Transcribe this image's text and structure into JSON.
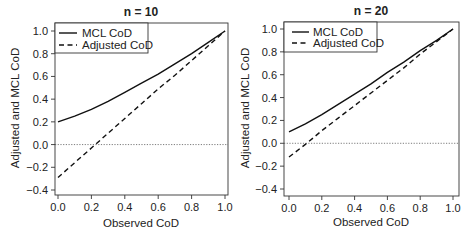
{
  "chart_data": [
    {
      "type": "line",
      "title": "n = 10",
      "xlabel": "Observed CoD",
      "ylabel": "Adjusted and MCL CoD",
      "xlim": [
        0.0,
        1.0
      ],
      "ylim": [
        -0.45,
        1.05
      ],
      "xticks": [
        "0.0",
        "0.2",
        "0.4",
        "0.6",
        "0.8",
        "1.0"
      ],
      "yticks": [
        "-0.4",
        "-0.2",
        "0.0",
        "0.2",
        "0.4",
        "0.6",
        "0.8",
        "1.0"
      ],
      "grid": false,
      "legend_position": "top-left",
      "reference_line": {
        "y": 0.0,
        "style": "dotted"
      },
      "x": [
        0.0,
        0.1,
        0.2,
        0.3,
        0.4,
        0.5,
        0.6,
        0.7,
        0.8,
        0.9,
        1.0
      ],
      "series": [
        {
          "name": "MCL CoD",
          "style": "solid",
          "values": [
            0.2,
            0.25,
            0.31,
            0.38,
            0.46,
            0.54,
            0.62,
            0.71,
            0.8,
            0.9,
            1.0
          ]
        },
        {
          "name": "Adjusted CoD",
          "style": "dashed",
          "values": [
            -0.29,
            -0.16,
            -0.03,
            0.1,
            0.23,
            0.36,
            0.49,
            0.61,
            0.74,
            0.87,
            1.0
          ]
        }
      ]
    },
    {
      "type": "line",
      "title": "n = 20",
      "xlabel": "Observed CoD",
      "ylabel": "Adjusted and MCL CoD",
      "xlim": [
        0.0,
        1.0
      ],
      "ylim": [
        -0.45,
        1.05
      ],
      "xticks": [
        "0.0",
        "0.2",
        "0.4",
        "0.6",
        "0.8",
        "1.0"
      ],
      "yticks": [
        "-0.4",
        "-0.2",
        "0.0",
        "0.2",
        "0.4",
        "0.6",
        "0.8",
        "1.0"
      ],
      "grid": false,
      "legend_position": "top-left",
      "reference_line": {
        "y": 0.0,
        "style": "dotted"
      },
      "x": [
        0.0,
        0.1,
        0.2,
        0.3,
        0.4,
        0.5,
        0.6,
        0.7,
        0.8,
        0.9,
        1.0
      ],
      "series": [
        {
          "name": "MCL CoD",
          "style": "solid",
          "values": [
            0.1,
            0.17,
            0.25,
            0.34,
            0.43,
            0.52,
            0.62,
            0.71,
            0.81,
            0.9,
            1.0
          ]
        },
        {
          "name": "Adjusted CoD",
          "style": "dashed",
          "values": [
            -0.12,
            -0.01,
            0.11,
            0.22,
            0.33,
            0.44,
            0.55,
            0.66,
            0.78,
            0.89,
            1.0
          ]
        }
      ]
    }
  ],
  "panels": [
    {
      "title": "n = 10",
      "xlabel": "Observed CoD",
      "ylabel": "Adjusted and MCL CoD",
      "legend": [
        "MCL CoD",
        "Adjusted CoD"
      ]
    },
    {
      "title": "n = 20",
      "xlabel": "Observed CoD",
      "ylabel": "Adjusted and MCL CoD",
      "legend": [
        "MCL CoD",
        "Adjusted CoD"
      ]
    }
  ]
}
